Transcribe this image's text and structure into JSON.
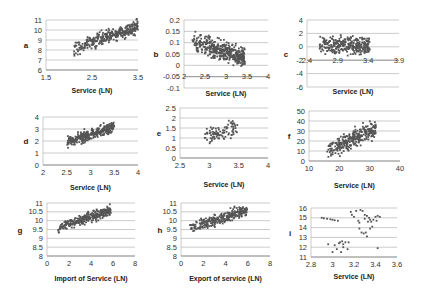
{
  "chart_data": [
    {
      "id": "a",
      "type": "scatter",
      "panel_label": "a",
      "xlabel": "Service (LN)",
      "ylabel": "",
      "xlim": [
        1.5,
        3.5
      ],
      "ylim": [
        6,
        11
      ],
      "xticks": [
        "1.5",
        "2.5",
        "3.5"
      ],
      "yticks": [
        "6",
        "7",
        "8",
        "9",
        "10",
        "11"
      ],
      "grid": true,
      "x_axis_at_y": 6,
      "series": [
        {
          "name": "a",
          "cloud": {
            "x_range": [
              2.1,
              3.5
            ],
            "y_center_at_x_min": 8.1,
            "y_center_at_x_max": 10.4,
            "spread": 0.55,
            "n": 320
          }
        }
      ]
    },
    {
      "id": "b",
      "type": "scatter",
      "panel_label": "b",
      "xlabel": "Service (LN)",
      "ylabel": "",
      "xlim": [
        2,
        4
      ],
      "ylim": [
        -0.1,
        0.2
      ],
      "xticks": [
        "2",
        "2.5",
        "3",
        "3.5",
        "4"
      ],
      "yticks": [
        "-0.1",
        "-0.05",
        "0",
        "0.05",
        "0.1",
        "0.15",
        "0.2"
      ],
      "grid": true,
      "x_axis_at_y": -0.05,
      "series": [
        {
          "name": "b",
          "cloud": {
            "x_range": [
              2.2,
              3.45
            ],
            "y_center_at_x_min": 0.1,
            "y_center_at_x_max": 0.035,
            "spread": 0.035,
            "n": 420
          }
        }
      ]
    },
    {
      "id": "c",
      "type": "scatter",
      "panel_label": "c",
      "xlabel": "Service (LN)",
      "ylabel": "",
      "xlim": [
        2.4,
        3.9
      ],
      "ylim": [
        -6,
        4
      ],
      "xticks": [
        "2.4",
        "2.9",
        "3.4",
        "3.9"
      ],
      "yticks": [
        "-6",
        "-4",
        "-2",
        "0",
        "2",
        "4"
      ],
      "grid": true,
      "x_axis_at_y": -2,
      "series": [
        {
          "name": "c",
          "cloud": {
            "x_range": [
              2.6,
              3.42
            ],
            "y_center_at_x_min": 0.3,
            "y_center_at_x_max": 0.2,
            "spread": 1.1,
            "n": 300
          }
        }
      ]
    },
    {
      "id": "d",
      "type": "scatter",
      "panel_label": "d",
      "xlabel": "Service (LN)",
      "ylabel": "",
      "xlim": [
        2,
        4
      ],
      "ylim": [
        0,
        4
      ],
      "xticks": [
        "2",
        "2.5",
        "3",
        "3.5",
        "4"
      ],
      "yticks": [
        "0",
        "1",
        "2",
        "3",
        "4"
      ],
      "grid": true,
      "x_axis_at_y": 0,
      "series": [
        {
          "name": "d",
          "cloud": {
            "x_range": [
              2.5,
              3.5
            ],
            "y_center_at_x_min": 1.9,
            "y_center_at_x_max": 3.2,
            "spread": 0.35,
            "n": 320
          }
        }
      ]
    },
    {
      "id": "e",
      "type": "scatter",
      "panel_label": "e",
      "xlabel": "Service (LN)",
      "ylabel": "",
      "xlim": [
        2.5,
        4
      ],
      "ylim": [
        0,
        2.5
      ],
      "xticks": [
        "2.5",
        "3",
        "3.5",
        "4"
      ],
      "yticks": [
        "0",
        "0.5",
        "1",
        "1.5",
        "2",
        "2.5"
      ],
      "grid": true,
      "x_axis_at_y": 0,
      "series": [
        {
          "name": "e",
          "cloud": {
            "x_range": [
              2.9,
              3.48
            ],
            "y_center_at_x_min": 1.0,
            "y_center_at_x_max": 1.6,
            "spread": 0.35,
            "n": 90
          }
        }
      ]
    },
    {
      "id": "f",
      "type": "scatter",
      "panel_label": "f",
      "xlabel": "Service (LN)",
      "ylabel": "",
      "xlim": [
        10,
        40
      ],
      "ylim": [
        0,
        50
      ],
      "xticks": [
        "10",
        "20",
        "30",
        "40"
      ],
      "yticks": [
        "0",
        "10",
        "20",
        "30",
        "40",
        "50"
      ],
      "grid": true,
      "x_axis_at_y": 0,
      "series": [
        {
          "name": "f",
          "cloud": {
            "x_range": [
              16,
              32
            ],
            "y_center_at_x_min": 10,
            "y_center_at_x_max": 32,
            "spread": 7,
            "n": 300
          }
        }
      ]
    },
    {
      "id": "g",
      "type": "scatter",
      "panel_label": "g",
      "xlabel": "Import of Service (LN)",
      "ylabel": "",
      "xlim": [
        0,
        8
      ],
      "ylim": [
        8,
        11
      ],
      "xticks": [
        "0",
        "2",
        "4",
        "6",
        "8"
      ],
      "yticks": [
        "8",
        "8.5",
        "9",
        "9.5",
        "10",
        "10.5",
        "11"
      ],
      "grid": true,
      "x_axis_at_y": 8,
      "series": [
        {
          "name": "g",
          "cloud": {
            "x_range": [
              1.0,
              5.8
            ],
            "y_center_at_x_min": 9.6,
            "y_center_at_x_max": 10.6,
            "spread": 0.25,
            "n": 280
          }
        }
      ]
    },
    {
      "id": "h",
      "type": "scatter",
      "panel_label": "h",
      "xlabel": "Export of service (LN)",
      "ylabel": "",
      "xlim": [
        0,
        8
      ],
      "ylim": [
        8,
        11
      ],
      "xticks": [
        "0",
        "2",
        "4",
        "6",
        "8"
      ],
      "yticks": [
        "8",
        "8.5",
        "9",
        "9.5",
        "10",
        "10.5",
        "11"
      ],
      "grid": true,
      "x_axis_at_y": 8,
      "series": [
        {
          "name": "h",
          "cloud": {
            "x_range": [
              0.8,
              6.0
            ],
            "y_center_at_x_min": 9.6,
            "y_center_at_x_max": 10.6,
            "spread": 0.25,
            "n": 280
          }
        }
      ]
    },
    {
      "id": "i",
      "type": "scatter",
      "panel_label": "i",
      "xlabel": "Service (LN)",
      "ylabel": "",
      "xlim": [
        2.8,
        3.6
      ],
      "ylim": [
        11,
        16
      ],
      "xticks": [
        "2.8",
        "3",
        "3.2",
        "3.4",
        "3.6"
      ],
      "yticks": [
        "11",
        "12",
        "13",
        "14",
        "15",
        "16"
      ],
      "grid": true,
      "x_axis_at_y": 11,
      "series": [
        {
          "name": "i",
          "points": [
            [
              2.9,
              15.0
            ],
            [
              2.92,
              14.95
            ],
            [
              2.95,
              14.9
            ],
            [
              2.98,
              14.85
            ],
            [
              3.0,
              14.8
            ],
            [
              3.02,
              14.75
            ],
            [
              3.05,
              14.7
            ],
            [
              2.96,
              12.3
            ],
            [
              3.0,
              11.5
            ],
            [
              3.02,
              12.2
            ],
            [
              3.04,
              11.8
            ],
            [
              3.06,
              12.4
            ],
            [
              3.07,
              12.5
            ],
            [
              3.08,
              11.5
            ],
            [
              3.09,
              12.6
            ],
            [
              3.1,
              12.3
            ],
            [
              3.1,
              12.0
            ],
            [
              3.12,
              12.5
            ],
            [
              3.14,
              11.8
            ],
            [
              3.15,
              12.5
            ],
            [
              3.17,
              15.6
            ],
            [
              3.18,
              15.3
            ],
            [
              3.2,
              15.1
            ],
            [
              3.22,
              15.7
            ],
            [
              3.24,
              14.7
            ],
            [
              3.25,
              14.5
            ],
            [
              3.25,
              13.9
            ],
            [
              3.26,
              15.8
            ],
            [
              3.27,
              13.5
            ],
            [
              3.28,
              15.7
            ],
            [
              3.29,
              13.4
            ],
            [
              3.3,
              15.3
            ],
            [
              3.3,
              14.9
            ],
            [
              3.31,
              13.5
            ],
            [
              3.32,
              15.2
            ],
            [
              3.32,
              13.1
            ],
            [
              3.33,
              14.6
            ],
            [
              3.34,
              15.0
            ],
            [
              3.35,
              14.8
            ],
            [
              3.35,
              13.9
            ],
            [
              3.36,
              14.6
            ],
            [
              3.37,
              14.1
            ],
            [
              3.38,
              14.8
            ],
            [
              3.4,
              15.1
            ],
            [
              3.41,
              14.7
            ],
            [
              3.42,
              15.2
            ],
            [
              3.42,
              11.9
            ],
            [
              3.44,
              15.1
            ]
          ]
        }
      ]
    }
  ]
}
